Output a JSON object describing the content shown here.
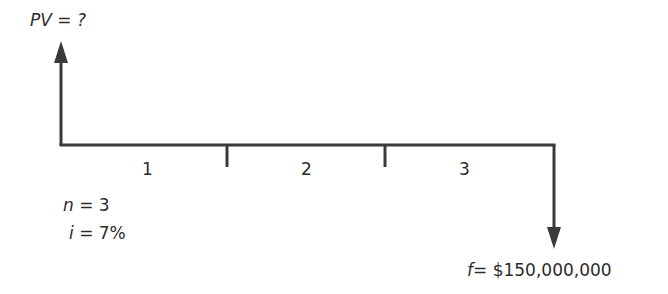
{
  "diagram": {
    "type": "cash-flow-timeline",
    "present_value": {
      "variable": "PV",
      "equals": " = ",
      "value": "?"
    },
    "periods": [
      {
        "label": "1"
      },
      {
        "label": "2"
      },
      {
        "label": "3"
      }
    ],
    "parameters": {
      "n": {
        "variable": "n",
        "equals": " = ",
        "value": "3"
      },
      "i": {
        "variable": "i",
        "equals": " = ",
        "value": "7%"
      }
    },
    "future_value": {
      "variable": "f",
      "equals": "= ",
      "value": "$150,000,000"
    },
    "colors": {
      "line": "#3a3a3a",
      "text": "#2b2b2b",
      "background": "#ffffff"
    }
  }
}
